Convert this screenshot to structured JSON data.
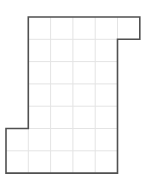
{
  "diagram": {
    "type": "grid-polygon",
    "grid": {
      "origin_px": [
        6,
        17
      ],
      "cell_px": 22.3,
      "cols": 6,
      "rows": 7,
      "line_color": "#e4e4e4"
    },
    "polygon": {
      "vertices_grid": [
        [
          1,
          0
        ],
        [
          6,
          0
        ],
        [
          6,
          1
        ],
        [
          5,
          1
        ],
        [
          5,
          7
        ],
        [
          0,
          7
        ],
        [
          0,
          5
        ],
        [
          1,
          5
        ]
      ],
      "stroke_color": "#505050",
      "fill_color": "#ffffff"
    }
  }
}
